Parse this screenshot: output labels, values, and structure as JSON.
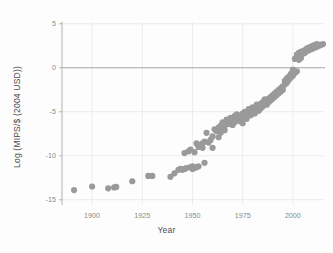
{
  "chart_data": {
    "type": "scatter",
    "title": "",
    "xlabel": "Year",
    "ylabel": "Log (MIPS/$ (2004 USD))",
    "xlim": [
      1885,
      2016
    ],
    "ylim": [
      -15.6,
      5.2
    ],
    "xticks": [
      1900,
      1925,
      1950,
      1975,
      2000
    ],
    "xtick_labels": [
      "1900",
      "1925",
      "1950",
      "1975",
      "2000"
    ],
    "yticks": [
      5,
      0,
      -5,
      -10,
      -15
    ],
    "ytick_labels": [
      "5",
      "0",
      "-5",
      "-10",
      "-15"
    ],
    "grid": true,
    "legend": false,
    "marker_color": "#9a9a9a",
    "marker_size": 3.1,
    "zero_line": 0,
    "points": [
      [
        1891,
        -13.9
      ],
      [
        1900,
        -13.5
      ],
      [
        1908,
        -13.7
      ],
      [
        1911,
        -13.6
      ],
      [
        1912,
        -13.55
      ],
      [
        1920,
        -12.9
      ],
      [
        1928,
        -12.3
      ],
      [
        1930,
        -12.3
      ],
      [
        1939,
        -12.4
      ],
      [
        1941,
        -12.0
      ],
      [
        1943,
        -11.6
      ],
      [
        1944,
        -11.5
      ],
      [
        1945,
        -11.6
      ],
      [
        1946,
        -11.5
      ],
      [
        1946,
        -9.7
      ],
      [
        1947,
        -11.4
      ],
      [
        1948,
        -9.5
      ],
      [
        1949,
        -11.3
      ],
      [
        1949,
        -9.3
      ],
      [
        1950,
        -11.5
      ],
      [
        1950,
        -11.2
      ],
      [
        1951,
        -11.4
      ],
      [
        1951,
        -9.6
      ],
      [
        1952,
        -11.3
      ],
      [
        1952,
        -8.6
      ],
      [
        1953,
        -11.2
      ],
      [
        1953,
        -9.0
      ],
      [
        1954,
        -8.8
      ],
      [
        1955,
        -8.6
      ],
      [
        1955,
        -9.1
      ],
      [
        1956,
        -10.8
      ],
      [
        1956,
        -8.4
      ],
      [
        1957,
        -7.4
      ],
      [
        1958,
        -8.5
      ],
      [
        1959,
        -8.2
      ],
      [
        1960,
        -9.1
      ],
      [
        1960,
        -7.8
      ],
      [
        1961,
        -7.0
      ],
      [
        1962,
        -7.2
      ],
      [
        1963,
        -6.8
      ],
      [
        1963,
        -7.9
      ],
      [
        1964,
        -6.6
      ],
      [
        1964,
        -7.4
      ],
      [
        1965,
        -6.9
      ],
      [
        1965,
        -6.2
      ],
      [
        1966,
        -6.6
      ],
      [
        1966,
        -7.1
      ],
      [
        1967,
        -6.3
      ],
      [
        1967,
        -5.9
      ],
      [
        1968,
        -6.4
      ],
      [
        1968,
        -6.0
      ],
      [
        1969,
        -6.1
      ],
      [
        1969,
        -5.7
      ],
      [
        1970,
        -6.5
      ],
      [
        1970,
        -5.8
      ],
      [
        1971,
        -6.2
      ],
      [
        1971,
        -5.5
      ],
      [
        1972,
        -6.0
      ],
      [
        1972,
        -5.3
      ],
      [
        1973,
        -5.9
      ],
      [
        1973,
        -5.6
      ],
      [
        1974,
        -6.1
      ],
      [
        1974,
        -5.4
      ],
      [
        1975,
        -5.7
      ],
      [
        1975,
        -5.2
      ],
      [
        1975,
        -6.3
      ],
      [
        1976,
        -5.5
      ],
      [
        1976,
        -5.0
      ],
      [
        1977,
        -5.3
      ],
      [
        1977,
        -5.8
      ],
      [
        1978,
        -5.1
      ],
      [
        1978,
        -4.7
      ],
      [
        1979,
        -5.4
      ],
      [
        1979,
        -4.9
      ],
      [
        1980,
        -5.0
      ],
      [
        1980,
        -4.5
      ],
      [
        1981,
        -4.8
      ],
      [
        1981,
        -5.2
      ],
      [
        1982,
        -4.6
      ],
      [
        1982,
        -4.2
      ],
      [
        1983,
        -4.4
      ],
      [
        1983,
        -4.9
      ],
      [
        1984,
        -4.1
      ],
      [
        1984,
        -4.6
      ],
      [
        1985,
        -3.9
      ],
      [
        1985,
        -4.4
      ],
      [
        1986,
        -4.0
      ],
      [
        1986,
        -3.6
      ],
      [
        1987,
        -3.8
      ],
      [
        1987,
        -4.2
      ],
      [
        1988,
        -3.5
      ],
      [
        1988,
        -3.9
      ],
      [
        1989,
        -3.3
      ],
      [
        1989,
        -3.7
      ],
      [
        1990,
        -3.1
      ],
      [
        1990,
        -3.5
      ],
      [
        1991,
        -2.9
      ],
      [
        1991,
        -3.3
      ],
      [
        1992,
        -2.7
      ],
      [
        1992,
        -3.1
      ],
      [
        1993,
        -2.5
      ],
      [
        1993,
        -2.9
      ],
      [
        1994,
        -2.3
      ],
      [
        1994,
        -2.7
      ],
      [
        1995,
        -2.1
      ],
      [
        1995,
        -2.5
      ],
      [
        1996,
        -1.9
      ],
      [
        1996,
        -1.5
      ],
      [
        1997,
        -1.7
      ],
      [
        1997,
        -1.2
      ],
      [
        1998,
        -1.4
      ],
      [
        1998,
        -1.0
      ],
      [
        1999,
        -1.1
      ],
      [
        1999,
        -0.7
      ],
      [
        2000,
        -0.9
      ],
      [
        2000,
        -0.5
      ],
      [
        2000,
        -0.2
      ],
      [
        2001,
        -0.6
      ],
      [
        2001,
        1.0
      ],
      [
        2002,
        -0.4
      ],
      [
        2002,
        1.2
      ],
      [
        2002,
        1.5
      ],
      [
        2003,
        1.3
      ],
      [
        2003,
        1.7
      ],
      [
        2003,
        0.9
      ],
      [
        2004,
        1.4
      ],
      [
        2004,
        1.8
      ],
      [
        2004,
        1.1
      ],
      [
        2005,
        1.6
      ],
      [
        2005,
        1.9
      ],
      [
        2006,
        1.7
      ],
      [
        2006,
        2.0
      ],
      [
        2007,
        1.9
      ],
      [
        2007,
        2.2
      ],
      [
        2008,
        2.0
      ],
      [
        2008,
        2.3
      ],
      [
        2009,
        2.1
      ],
      [
        2009,
        2.4
      ],
      [
        2010,
        2.2
      ],
      [
        2010,
        2.5
      ],
      [
        2011,
        2.3
      ],
      [
        2011,
        2.6
      ],
      [
        2012,
        2.4
      ],
      [
        2012,
        2.7
      ],
      [
        2013,
        2.5
      ],
      [
        2014,
        2.6
      ],
      [
        2015,
        2.7
      ]
    ]
  }
}
